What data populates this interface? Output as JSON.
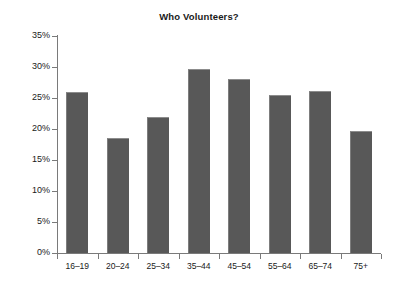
{
  "chart_data": {
    "type": "bar",
    "title": "Who Volunteers?",
    "xlabel": "",
    "ylabel": "",
    "categories": [
      "16–19",
      "20–24",
      "25–34",
      "35–44",
      "45–54",
      "55–64",
      "65–74",
      "75+"
    ],
    "values": [
      26.0,
      18.5,
      21.9,
      29.7,
      28.1,
      25.5,
      26.2,
      19.7
    ],
    "value_labels": [
      "26.0%",
      "18.5%",
      "21.9%",
      "29.7%",
      "28.1%",
      "25.5%",
      "26.2%",
      "19.7%"
    ],
    "ylim": [
      0,
      35
    ],
    "y_tick_values": [
      0,
      5,
      10,
      15,
      20,
      25,
      30,
      35
    ],
    "y_tick_labels": [
      "0%",
      "5%",
      "10%",
      "15%",
      "20%",
      "25%",
      "30%",
      "35%"
    ],
    "grid": false,
    "legend": null,
    "bar_color": "#585858",
    "axis_color": "#7a7a7a",
    "background_color": "#ffffff",
    "text_color": "#1a1a1a"
  }
}
